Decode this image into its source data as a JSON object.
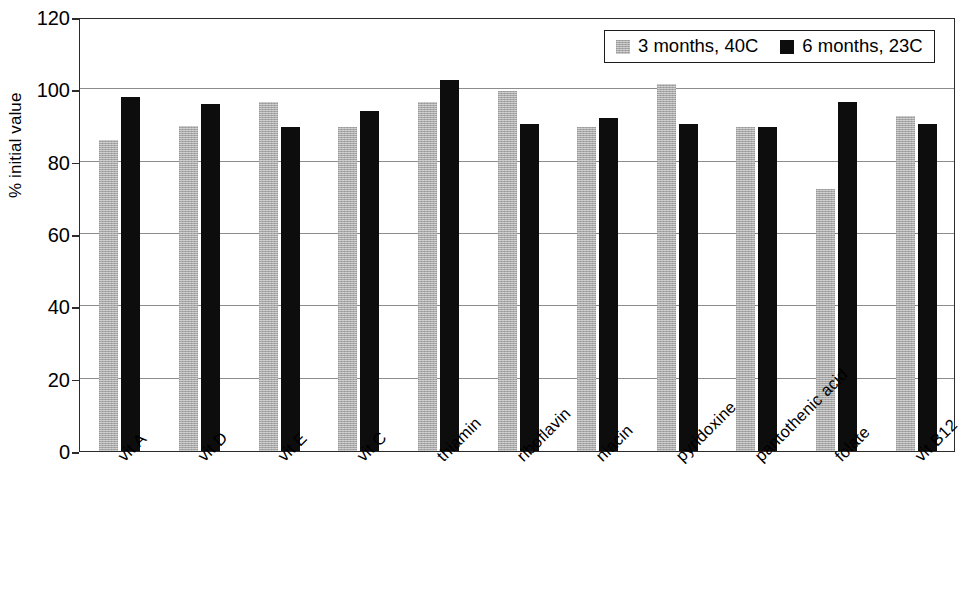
{
  "chart_data": {
    "type": "bar",
    "title": "",
    "xlabel": "",
    "ylabel": "% initial value",
    "ylim": [
      0,
      120
    ],
    "yticks": [
      0,
      20,
      40,
      60,
      80,
      100,
      120
    ],
    "grid": true,
    "legend_position": "top-right",
    "categories": [
      "vit A",
      "vit D",
      "vit E",
      "vit C",
      "thiamin",
      "riboflavin",
      "niacin",
      "pyridoxine",
      "pantothenic acid",
      "folate",
      "vit B12"
    ],
    "series": [
      {
        "name": "3 months, 40C",
        "color": "#a8a8a8",
        "values": [
          86,
          90,
          96.5,
          89.5,
          96.5,
          99.5,
          89.5,
          101.5,
          89.5,
          72.5,
          92.5
        ]
      },
      {
        "name": "6 months, 23C",
        "color": "#0d0d0d",
        "values": [
          98,
          96,
          89.5,
          94,
          102.5,
          90.5,
          92,
          90.5,
          89.5,
          96.5,
          90.5
        ]
      }
    ]
  },
  "legend": {
    "entries": [
      {
        "label": "3 months, 40C"
      },
      {
        "label": "6 months, 23C"
      }
    ]
  },
  "axes": {
    "y_title": "% initial value",
    "y_tick_labels": [
      "120",
      "100",
      "80",
      "60",
      "40",
      "20",
      "0"
    ]
  }
}
